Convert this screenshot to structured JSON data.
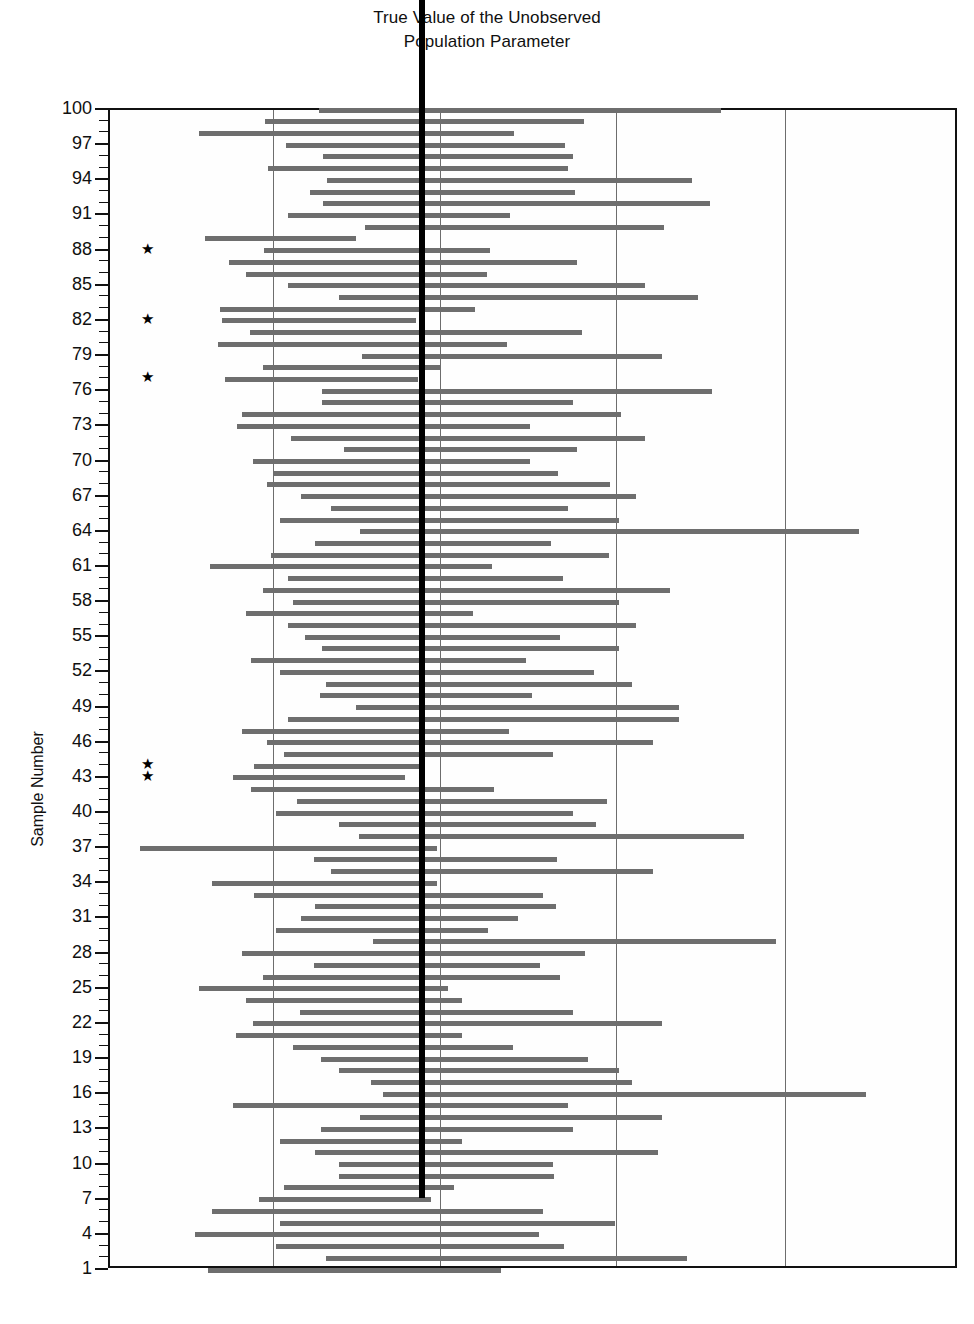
{
  "chart_title_line1": "True Value of the Unobserved",
  "chart_title_line2": "Population Parameter",
  "y_axis_title": "Sample Number",
  "colors": {
    "bar": "#6e6e6e",
    "true_value_line": "#000000",
    "gridline": "#6d6d6d",
    "frame": "#111111",
    "background": "#ffffff"
  },
  "chart_data": {
    "type": "bar",
    "subtype": "confidence-interval-plot",
    "title": "True Value of the Unobserved Population Parameter",
    "xlabel": "",
    "ylabel": "Sample Number",
    "ylim": [
      1,
      100
    ],
    "xlim": [
      0,
      100
    ],
    "grid": true,
    "legend": null,
    "true_value": 37.0,
    "y_tick_labels": [
      1,
      4,
      7,
      10,
      13,
      16,
      19,
      22,
      25,
      28,
      31,
      34,
      37,
      40,
      43,
      46,
      49,
      52,
      55,
      58,
      61,
      64,
      67,
      70,
      73,
      76,
      79,
      82,
      85,
      88,
      91,
      94,
      97,
      100
    ],
    "y_minor_tick_step": 1,
    "x_gridlines": [
      19.2,
      38.9,
      59.6,
      79.5
    ],
    "annotation_symbol": "★",
    "annotation_note": "Stars mark intervals that fail to capture the true parameter value",
    "missed_samples": [
      88,
      82,
      77,
      44,
      43
    ],
    "categories": [
      1,
      2,
      3,
      4,
      5,
      6,
      7,
      8,
      9,
      10,
      11,
      12,
      13,
      14,
      15,
      16,
      17,
      18,
      19,
      20,
      21,
      22,
      23,
      24,
      25,
      26,
      27,
      28,
      29,
      30,
      31,
      32,
      33,
      34,
      35,
      36,
      37,
      38,
      39,
      40,
      41,
      42,
      43,
      44,
      45,
      46,
      47,
      48,
      49,
      50,
      51,
      52,
      53,
      54,
      55,
      56,
      57,
      58,
      59,
      60,
      61,
      62,
      63,
      64,
      65,
      66,
      67,
      68,
      69,
      70,
      71,
      72,
      73,
      74,
      75,
      76,
      77,
      78,
      79,
      80,
      81,
      82,
      83,
      84,
      85,
      86,
      87,
      88,
      89,
      90,
      91,
      92,
      93,
      94,
      95,
      96,
      97,
      98,
      99,
      100
    ],
    "series": [
      {
        "name": "95% Confidence Interval",
        "intervals": [
          {
            "sample": 100,
            "lower": 24.6,
            "upper": 72.0
          },
          {
            "sample": 99,
            "lower": 18.3,
            "upper": 55.8
          },
          {
            "sample": 98,
            "lower": 10.5,
            "upper": 47.6
          },
          {
            "sample": 97,
            "lower": 20.7,
            "upper": 53.6
          },
          {
            "sample": 96,
            "lower": 25.1,
            "upper": 54.5
          },
          {
            "sample": 95,
            "lower": 18.6,
            "upper": 54.0
          },
          {
            "sample": 94,
            "lower": 25.6,
            "upper": 68.5
          },
          {
            "sample": 93,
            "lower": 23.6,
            "upper": 54.8
          },
          {
            "sample": 92,
            "lower": 25.1,
            "upper": 70.7
          },
          {
            "sample": 91,
            "lower": 21.0,
            "upper": 47.1
          },
          {
            "sample": 90,
            "lower": 30.0,
            "upper": 65.2
          },
          {
            "sample": 89,
            "lower": 11.2,
            "upper": 29.0
          },
          {
            "sample": 88,
            "lower": 18.1,
            "upper": 44.8
          },
          {
            "sample": 87,
            "lower": 14.0,
            "upper": 55.0
          },
          {
            "sample": 86,
            "lower": 16.0,
            "upper": 44.4
          },
          {
            "sample": 85,
            "lower": 21.0,
            "upper": 63.0
          },
          {
            "sample": 84,
            "lower": 27.0,
            "upper": 69.3
          },
          {
            "sample": 83,
            "lower": 13.0,
            "upper": 43.0
          },
          {
            "sample": 82,
            "lower": 13.2,
            "upper": 36.1
          },
          {
            "sample": 81,
            "lower": 16.5,
            "upper": 55.6
          },
          {
            "sample": 80,
            "lower": 12.7,
            "upper": 46.8
          },
          {
            "sample": 79,
            "lower": 29.7,
            "upper": 65.0
          },
          {
            "sample": 78,
            "lower": 18.0,
            "upper": 39.0
          },
          {
            "sample": 77,
            "lower": 13.5,
            "upper": 36.3
          },
          {
            "sample": 76,
            "lower": 25.0,
            "upper": 70.9
          },
          {
            "sample": 75,
            "lower": 25.0,
            "upper": 54.5
          },
          {
            "sample": 74,
            "lower": 15.5,
            "upper": 60.2
          },
          {
            "sample": 73,
            "lower": 15.0,
            "upper": 49.5
          },
          {
            "sample": 72,
            "lower": 21.3,
            "upper": 63.0
          },
          {
            "sample": 71,
            "lower": 27.6,
            "upper": 55.0
          },
          {
            "sample": 70,
            "lower": 16.8,
            "upper": 49.5
          },
          {
            "sample": 69,
            "lower": 19.3,
            "upper": 52.8
          },
          {
            "sample": 68,
            "lower": 18.5,
            "upper": 58.9
          },
          {
            "sample": 67,
            "lower": 22.5,
            "upper": 62.0
          },
          {
            "sample": 66,
            "lower": 26.0,
            "upper": 54.0
          },
          {
            "sample": 65,
            "lower": 20.0,
            "upper": 60.0
          },
          {
            "sample": 64,
            "lower": 29.5,
            "upper": 88.2
          },
          {
            "sample": 63,
            "lower": 24.2,
            "upper": 52.0
          },
          {
            "sample": 62,
            "lower": 19.0,
            "upper": 58.8
          },
          {
            "sample": 61,
            "lower": 11.8,
            "upper": 45.0
          },
          {
            "sample": 60,
            "lower": 21.0,
            "upper": 53.3
          },
          {
            "sample": 59,
            "lower": 18.0,
            "upper": 66.0
          },
          {
            "sample": 58,
            "lower": 21.5,
            "upper": 60.0
          },
          {
            "sample": 57,
            "lower": 16.0,
            "upper": 42.8
          },
          {
            "sample": 56,
            "lower": 21.0,
            "upper": 62.0
          },
          {
            "sample": 55,
            "lower": 23.0,
            "upper": 53.0
          },
          {
            "sample": 54,
            "lower": 25.0,
            "upper": 60.0
          },
          {
            "sample": 53,
            "lower": 16.6,
            "upper": 49.0
          },
          {
            "sample": 52,
            "lower": 20.0,
            "upper": 57.0
          },
          {
            "sample": 51,
            "lower": 25.5,
            "upper": 61.5
          },
          {
            "sample": 50,
            "lower": 24.7,
            "upper": 49.7
          },
          {
            "sample": 49,
            "lower": 29.0,
            "upper": 67.0
          },
          {
            "sample": 48,
            "lower": 21.0,
            "upper": 67.0
          },
          {
            "sample": 47,
            "lower": 15.5,
            "upper": 47.0
          },
          {
            "sample": 46,
            "lower": 18.5,
            "upper": 64.0
          },
          {
            "sample": 45,
            "lower": 20.5,
            "upper": 52.2
          },
          {
            "sample": 44,
            "lower": 17.0,
            "upper": 36.6
          },
          {
            "sample": 43,
            "lower": 14.5,
            "upper": 34.8
          },
          {
            "sample": 42,
            "lower": 16.6,
            "upper": 45.2
          },
          {
            "sample": 41,
            "lower": 22.0,
            "upper": 58.5
          },
          {
            "sample": 40,
            "lower": 19.6,
            "upper": 54.5
          },
          {
            "sample": 39,
            "lower": 27.0,
            "upper": 57.3
          },
          {
            "sample": 38,
            "lower": 29.3,
            "upper": 74.7
          },
          {
            "sample": 37,
            "lower": 3.5,
            "upper": 38.5
          },
          {
            "sample": 36,
            "lower": 24.0,
            "upper": 52.6
          },
          {
            "sample": 35,
            "lower": 26.0,
            "upper": 64.0
          },
          {
            "sample": 34,
            "lower": 12.0,
            "upper": 38.5
          },
          {
            "sample": 33,
            "lower": 17.0,
            "upper": 51.0
          },
          {
            "sample": 32,
            "lower": 24.1,
            "upper": 52.5
          },
          {
            "sample": 31,
            "lower": 22.5,
            "upper": 48.0
          },
          {
            "sample": 30,
            "lower": 19.6,
            "upper": 44.5
          },
          {
            "sample": 29,
            "lower": 31.0,
            "upper": 78.5
          },
          {
            "sample": 28,
            "lower": 15.5,
            "upper": 56.0
          },
          {
            "sample": 27,
            "lower": 24.0,
            "upper": 50.7
          },
          {
            "sample": 26,
            "lower": 18.0,
            "upper": 53.0
          },
          {
            "sample": 25,
            "lower": 10.5,
            "upper": 39.8
          },
          {
            "sample": 24,
            "lower": 16.0,
            "upper": 41.5
          },
          {
            "sample": 23,
            "lower": 22.4,
            "upper": 54.5
          },
          {
            "sample": 22,
            "lower": 16.8,
            "upper": 65.0
          },
          {
            "sample": 21,
            "lower": 14.8,
            "upper": 41.5
          },
          {
            "sample": 20,
            "lower": 21.5,
            "upper": 47.5
          },
          {
            "sample": 19,
            "lower": 24.8,
            "upper": 56.3
          },
          {
            "sample": 18,
            "lower": 27.0,
            "upper": 60.0
          },
          {
            "sample": 17,
            "lower": 30.8,
            "upper": 61.5
          },
          {
            "sample": 16,
            "lower": 32.2,
            "upper": 89.0
          },
          {
            "sample": 15,
            "lower": 14.5,
            "upper": 54.0
          },
          {
            "sample": 14,
            "lower": 29.5,
            "upper": 65.0
          },
          {
            "sample": 13,
            "lower": 24.8,
            "upper": 54.5
          },
          {
            "sample": 12,
            "lower": 20.0,
            "upper": 41.5
          },
          {
            "sample": 11,
            "lower": 24.2,
            "upper": 64.5
          },
          {
            "sample": 10,
            "lower": 27.0,
            "upper": 52.2
          },
          {
            "sample": 9,
            "lower": 27.0,
            "upper": 52.3
          },
          {
            "sample": 8,
            "lower": 20.5,
            "upper": 40.5
          },
          {
            "sample": 7,
            "lower": 17.5,
            "upper": 37.8
          },
          {
            "sample": 6,
            "lower": 12.0,
            "upper": 51.0
          },
          {
            "sample": 5,
            "lower": 20.0,
            "upper": 59.5
          },
          {
            "sample": 4,
            "lower": 10.0,
            "upper": 50.5
          },
          {
            "sample": 3,
            "lower": 19.5,
            "upper": 53.5
          },
          {
            "sample": 2,
            "lower": 25.5,
            "upper": 68.0
          },
          {
            "sample": 1,
            "lower": 11.5,
            "upper": 46.0
          }
        ]
      }
    ]
  }
}
